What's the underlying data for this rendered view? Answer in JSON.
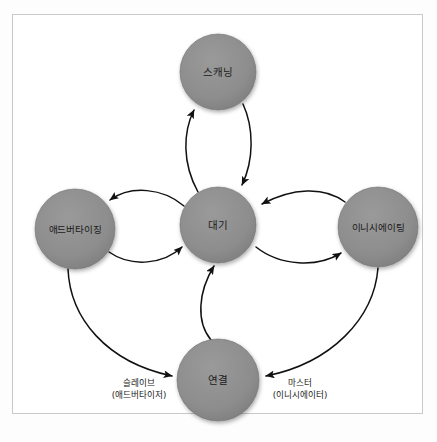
{
  "figure": {
    "kind": "state-diagram",
    "background_color": "#ffffff",
    "frame_border_color": "#c9c9c9",
    "node_fill_color": "#8d8d8d",
    "node_stroke_color": "#6f6f6f",
    "edge_color": "#111111",
    "text_color": "#1b1b1b"
  },
  "nodes": [
    {
      "id": "scanning",
      "label": "스캐닝",
      "cx": 218,
      "cy": 72,
      "r": 38
    },
    {
      "id": "advertising",
      "label": "애드버타이징",
      "cx": 75,
      "cy": 229,
      "r": 40
    },
    {
      "id": "standby",
      "label": "대기",
      "cx": 218,
      "cy": 225,
      "r": 38
    },
    {
      "id": "initiating",
      "label": "이니시에이팅",
      "cx": 378,
      "cy": 227,
      "r": 40
    },
    {
      "id": "connection",
      "label": "연결",
      "cx": 218,
      "cy": 380,
      "r": 41
    }
  ],
  "edges": [
    {
      "id": "standby-to-scanning",
      "from": "standby",
      "to": "scanning",
      "direction": "forward"
    },
    {
      "id": "scanning-to-standby",
      "from": "scanning",
      "to": "standby",
      "direction": "forward"
    },
    {
      "id": "standby-to-advertising",
      "from": "standby",
      "to": "advertising",
      "direction": "forward"
    },
    {
      "id": "advertising-to-standby",
      "from": "advertising",
      "to": "standby",
      "direction": "forward"
    },
    {
      "id": "initiating-to-standby",
      "from": "initiating",
      "to": "standby",
      "direction": "forward"
    },
    {
      "id": "standby-to-initiating",
      "from": "standby",
      "to": "initiating",
      "direction": "forward"
    },
    {
      "id": "connection-to-standby",
      "from": "connection",
      "to": "standby",
      "direction": "forward"
    },
    {
      "id": "advertising-to-connection",
      "from": "advertising",
      "to": "connection",
      "direction": "forward"
    },
    {
      "id": "initiating-to-connection",
      "from": "initiating",
      "to": "connection",
      "direction": "forward"
    }
  ],
  "role_labels": {
    "slave": {
      "line1": "슬레이브",
      "line2": "(애드버타이저)",
      "x": 139,
      "y": 386
    },
    "master": {
      "line1": "마스터",
      "line2": "(이니시에이터)",
      "x": 300,
      "y": 386
    }
  }
}
